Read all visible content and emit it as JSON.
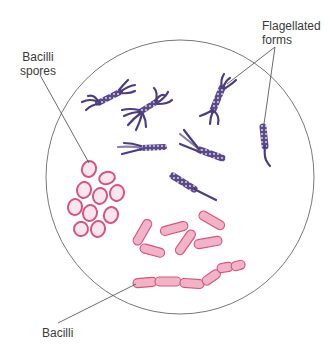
{
  "diagram": {
    "field": {
      "shape": "circle",
      "cx": 180,
      "cy": 177,
      "rx": 134,
      "ry": 137,
      "stroke": "#555555"
    },
    "colors": {
      "flagellated_fill": "#5a4a8a",
      "flagellated_dark": "#3e2f6e",
      "flagellated_light": "#d9d2ea",
      "bacilli_fill": "#f2b3c6",
      "bacilli_stroke": "#d6557e",
      "spore_inner": "#fbe6ee",
      "leader_line": "#444444",
      "label_text": "#3a3a3a"
    },
    "labels": {
      "flagellated": {
        "line1": "Flagellated",
        "line2": "forms"
      },
      "spores": {
        "line1": "Bacilli",
        "line2": "spores"
      },
      "bacilli": {
        "line1": "Bacilli"
      }
    },
    "groups": [
      {
        "name": "Flagellated forms",
        "count": 7,
        "color": "purple"
      },
      {
        "name": "Bacilli spores",
        "count": 11,
        "color": "pink"
      },
      {
        "name": "Bacilli",
        "count": 6,
        "color": "pink",
        "chain_segments": 6
      }
    ]
  }
}
